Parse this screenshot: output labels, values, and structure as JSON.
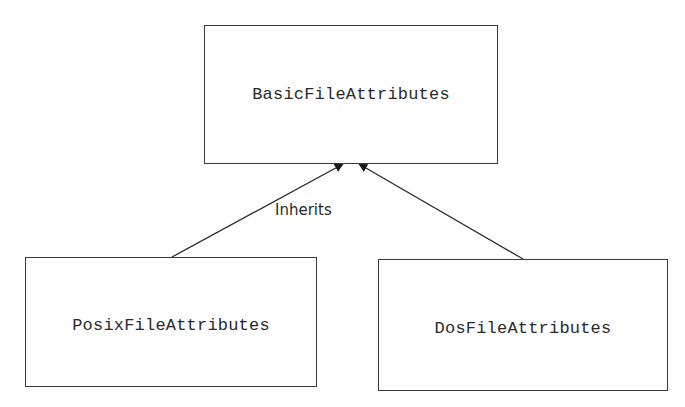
{
  "diagram": {
    "type": "class-inheritance",
    "colors": {
      "stroke": "#3a3a3a",
      "text": "#2a2a2a",
      "background": "#ffffff"
    },
    "nodes": [
      {
        "id": "basic",
        "label": "BasicFileAttributes"
      },
      {
        "id": "posix",
        "label": "PosixFileAttributes"
      },
      {
        "id": "dos",
        "label": "DosFileAttributes"
      }
    ],
    "edges": [
      {
        "from": "posix",
        "to": "basic",
        "arrow": "filled-triangle"
      },
      {
        "from": "dos",
        "to": "basic",
        "arrow": "filled-triangle"
      }
    ],
    "edge_label": "Inherits"
  }
}
